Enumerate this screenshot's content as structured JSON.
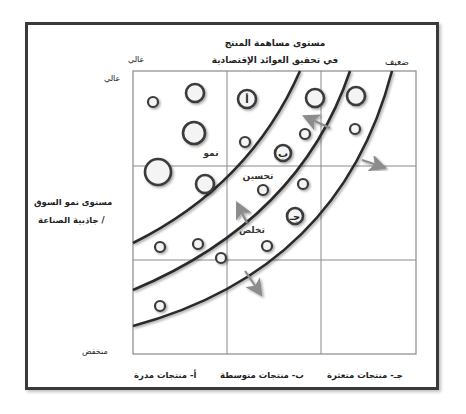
{
  "diagram": {
    "title_line1": "مستوى مساهمة المنتج",
    "title_line2": "في تحقيق العوائد الإقتصادية",
    "x_axis": {
      "high_label": "عالي",
      "low_label": "ضعيف"
    },
    "y_axis": {
      "label_line1": "مستوى نمو السوق",
      "label_line2": "/ جاذبية الصناعة",
      "high_label": "عالي",
      "low_label": "منخفض"
    },
    "categories": [
      {
        "id": "a",
        "label": "أ- منتجات مدرة"
      },
      {
        "id": "b",
        "label": "ب- منتجات متوسطة"
      },
      {
        "id": "c",
        "label": "جـ- منتجات متعثرة"
      }
    ],
    "zones": [
      {
        "label": "نمو",
        "x": 211,
        "y": 156
      },
      {
        "label": "تحسين",
        "x": 258,
        "y": 179
      },
      {
        "label": "تخلص",
        "x": 252,
        "y": 233
      }
    ],
    "grid": {
      "left": 133,
      "top": 71,
      "right": 416,
      "bottom": 354,
      "v_lines": [
        227,
        321
      ],
      "h_lines": [
        166,
        260
      ],
      "line_color": "#8a8a8a"
    },
    "bubbles": [
      {
        "cx": 153,
        "cy": 102,
        "r": 5,
        "label": ""
      },
      {
        "cx": 195,
        "cy": 93,
        "r": 9,
        "label": ""
      },
      {
        "cx": 194,
        "cy": 133,
        "r": 11,
        "label": ""
      },
      {
        "cx": 247,
        "cy": 99,
        "r": 9,
        "label": "أ"
      },
      {
        "cx": 245,
        "cy": 142,
        "r": 5,
        "label": ""
      },
      {
        "cx": 315,
        "cy": 98,
        "r": 9,
        "label": ""
      },
      {
        "cx": 356,
        "cy": 96,
        "r": 9,
        "label": ""
      },
      {
        "cx": 355,
        "cy": 129,
        "r": 5,
        "label": ""
      },
      {
        "cx": 305,
        "cy": 134,
        "r": 5,
        "label": ""
      },
      {
        "cx": 283,
        "cy": 153,
        "r": 8,
        "label": "ب"
      },
      {
        "cx": 158,
        "cy": 172,
        "r": 13,
        "label": ""
      },
      {
        "cx": 205,
        "cy": 184,
        "r": 9,
        "label": ""
      },
      {
        "cx": 263,
        "cy": 190,
        "r": 5,
        "label": ""
      },
      {
        "cx": 303,
        "cy": 184,
        "r": 5,
        "label": ""
      },
      {
        "cx": 295,
        "cy": 216,
        "r": 8,
        "label": "جـ"
      },
      {
        "cx": 160,
        "cy": 247,
        "r": 5,
        "label": ""
      },
      {
        "cx": 198,
        "cy": 244,
        "r": 5,
        "label": ""
      },
      {
        "cx": 221,
        "cy": 258,
        "r": 5,
        "label": ""
      },
      {
        "cx": 267,
        "cy": 246,
        "r": 5,
        "label": ""
      },
      {
        "cx": 160,
        "cy": 306,
        "r": 5,
        "label": ""
      }
    ],
    "curves": [
      "M 133 243 Q 250 185 300 71",
      "M 133 290 Q 300 220 350 71",
      "M 133 326 Q 340 270 392 71"
    ],
    "arrows": [
      {
        "x1": 330,
        "y1": 128,
        "x2": 306,
        "y2": 117
      },
      {
        "x1": 362,
        "y1": 160,
        "x2": 383,
        "y2": 167
      },
      {
        "x1": 247,
        "y1": 223,
        "x2": 238,
        "y2": 205
      },
      {
        "x1": 245,
        "y1": 271,
        "x2": 260,
        "y2": 293
      }
    ],
    "colors": {
      "frame": "#3a3a3a",
      "curve": "#2a2a2a",
      "bubble_stroke": "#3a3a3a",
      "bubble_fill": "#f4f4f4",
      "arrow": "#8c8c8c"
    }
  }
}
